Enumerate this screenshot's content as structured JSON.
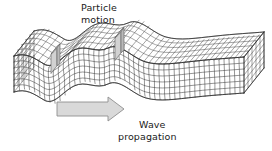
{
  "figure": {
    "background_color": "#ffffff",
    "width": 272,
    "height": 151
  },
  "labels": {
    "particle_motion": {
      "line1": "Particle",
      "line2": "motion",
      "color": "#1a1a1a"
    },
    "wave_propagation": {
      "line1": "Wave",
      "line2": "propagation",
      "color": "#1a1a1a"
    }
  },
  "arrow": {
    "name": "wave-propagation-arrow",
    "direction": "right",
    "fill": "#d9d9d9",
    "stroke": "#8a8a8a"
  },
  "block": {
    "name": "elastic-grid-block",
    "grid_stroke": "#3a3a3a",
    "grid_stroke_light": "#6e6e6e",
    "face_fill": "#ffffff",
    "columns": 34,
    "rows_front": 6,
    "rows_top": 5,
    "deformation": "shear wave: trough near left, crest near centre, undisturbed at right"
  },
  "particle_markers": {
    "name": "particle-motion-columns",
    "fill": "#cfcfcf",
    "stroke": "#5a5a5a",
    "count": 2
  }
}
